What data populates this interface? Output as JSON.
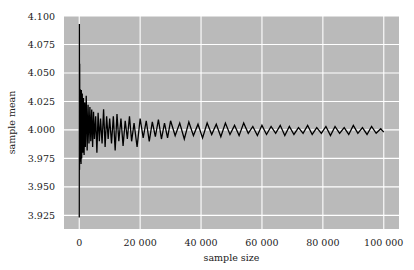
{
  "chart_data": {
    "type": "line",
    "title": "",
    "xlabel": "sample size",
    "ylabel": "sample mean",
    "xlim": [
      -5000,
      105000
    ],
    "ylim": [
      3.913,
      4.1
    ],
    "grid": true,
    "x_ticks": [
      0,
      20000,
      40000,
      60000,
      80000,
      100000
    ],
    "x_tick_labels": [
      "0",
      "20 000",
      "40 000",
      "60 000",
      "80 000",
      "100 000"
    ],
    "y_ticks": [
      3.925,
      3.95,
      3.975,
      4.0,
      4.025,
      4.05,
      4.075,
      4.1
    ],
    "y_tick_labels": [
      "3.925",
      "3.950",
      "3.975",
      "4.000",
      "4.025",
      "4.050",
      "4.075",
      "4.100"
    ],
    "colors": {
      "background": "#bababa",
      "grid": "#ffffff",
      "line": "#000000"
    },
    "series": [
      {
        "name": "sample mean",
        "x": [
          10,
          50,
          100,
          150,
          200,
          300,
          400,
          500,
          600,
          700,
          800,
          1000,
          1200,
          1400,
          1600,
          1800,
          2000,
          2300,
          2600,
          2900,
          3200,
          3500,
          3800,
          4100,
          4400,
          4700,
          5000,
          5400,
          5800,
          6200,
          6600,
          7000,
          7500,
          8000,
          8500,
          9000,
          9500,
          10000,
          10600,
          11200,
          11800,
          12400,
          13000,
          13700,
          14400,
          15100,
          15800,
          16500,
          17200,
          18000,
          19000,
          20000,
          21000,
          22000,
          23000,
          24000,
          25000,
          26000,
          27000,
          28000,
          29000,
          30000,
          31500,
          33000,
          34500,
          36000,
          37500,
          39000,
          40500,
          42000,
          43500,
          45000,
          46500,
          48000,
          49500,
          51000,
          52500,
          54000,
          55500,
          57000,
          58500,
          60000,
          61500,
          63000,
          64500,
          66000,
          67500,
          69000,
          70500,
          72000,
          73500,
          75000,
          76500,
          78000,
          79500,
          81000,
          82500,
          84000,
          85500,
          87000,
          88500,
          90000,
          91500,
          93000,
          94500,
          96000,
          97500,
          99000,
          100000
        ],
        "y": [
          3.923,
          4.093,
          3.965,
          4.058,
          3.985,
          4.036,
          3.972,
          4.03,
          3.97,
          4.035,
          3.975,
          4.032,
          3.98,
          4.028,
          3.978,
          4.024,
          3.985,
          4.03,
          3.982,
          4.022,
          3.988,
          4.02,
          3.99,
          4.018,
          3.985,
          4.016,
          3.992,
          4.012,
          3.98,
          4.015,
          3.99,
          4.01,
          3.988,
          4.018,
          3.985,
          4.012,
          3.992,
          4.01,
          3.988,
          4.012,
          3.982,
          4.014,
          3.99,
          4.01,
          3.986,
          4.008,
          3.992,
          4.012,
          3.99,
          4.006,
          3.985,
          4.01,
          3.993,
          4.008,
          3.99,
          4.007,
          3.994,
          4.009,
          3.992,
          4.006,
          3.993,
          4.008,
          3.995,
          4.006,
          3.992,
          4.007,
          3.995,
          4.005,
          3.993,
          4.006,
          3.996,
          4.005,
          3.994,
          4.006,
          3.996,
          4.004,
          3.995,
          4.006,
          3.997,
          4.003,
          3.995,
          4.004,
          3.996,
          4.003,
          3.997,
          4.004,
          3.995,
          4.003,
          3.996,
          4.002,
          3.997,
          4.004,
          3.996,
          4.002,
          3.997,
          4.003,
          3.995,
          4.003,
          3.997,
          4.002,
          3.996,
          4.004,
          3.997,
          4.002,
          3.996,
          4.003,
          3.997,
          4.001,
          3.998
        ]
      }
    ]
  }
}
